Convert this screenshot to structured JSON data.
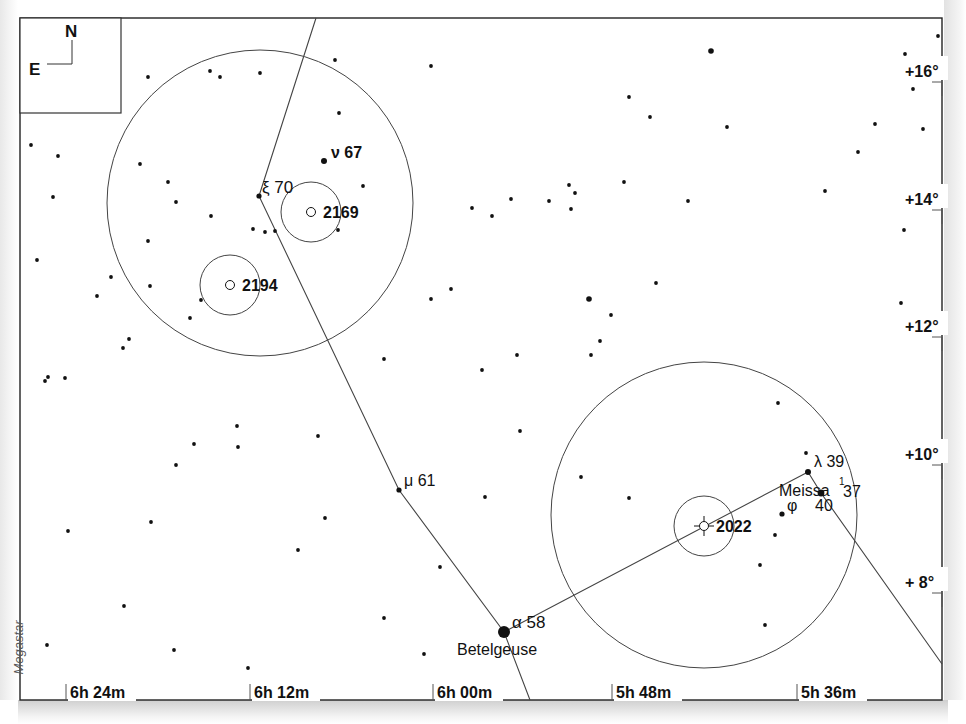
{
  "compass": {
    "north": "N",
    "east": "E"
  },
  "credit": "Megastar",
  "colors": {
    "ink": "#111111",
    "line": "#444444",
    "paper": "#ffffff"
  },
  "ra_axis": {
    "ticks": [
      {
        "label": "6h 24m",
        "x": 66
      },
      {
        "label": "6h 12m",
        "x": 250
      },
      {
        "label": "6h 00m",
        "x": 433
      },
      {
        "label": "5h 48m",
        "x": 612
      },
      {
        "label": "5h 36m",
        "x": 797
      }
    ]
  },
  "dec_axis": {
    "ticks": [
      {
        "label": "+16°",
        "y": 72
      },
      {
        "label": "+14°",
        "y": 200
      },
      {
        "label": "+12°",
        "y": 327
      },
      {
        "label": "+10°",
        "y": 455
      },
      {
        "label": "+ 8°",
        "y": 583
      }
    ]
  },
  "named_stars": [
    {
      "greek": "ν",
      "flamsteed": "67",
      "x": 324,
      "y": 161,
      "r": 3
    },
    {
      "greek": "ξ",
      "flamsteed": "70",
      "x": 259,
      "y": 196,
      "r": 2.6
    },
    {
      "greek": "μ",
      "flamsteed": "61",
      "x": 399,
      "y": 490,
      "r": 2.6
    },
    {
      "greek": "α",
      "flamsteed": "58",
      "name": "Betelgeuse",
      "x": 504,
      "y": 632,
      "r": 6
    },
    {
      "greek": "λ",
      "flamsteed": "39",
      "x": 808,
      "y": 472,
      "r": 3
    },
    {
      "greek": "φ",
      "flamsteed": "40",
      "x": 782,
      "y": 514,
      "r": 2.6
    },
    {
      "greek": "φ¹",
      "flamsteed": "37",
      "name": "Meissa",
      "x": 821,
      "y": 493,
      "r": 3.4
    }
  ],
  "labels": {
    "nu": "ν 67",
    "xi": "ξ 70",
    "mu": "μ 61",
    "alpha": "α 58",
    "betelgeuse": "Betelgeuse",
    "lambda": "λ 39",
    "meissa": "Meissa",
    "phi1_sup": "1",
    "phi1_num": "37",
    "phi": "φ",
    "phi_num": "40"
  },
  "deep_sky": [
    {
      "id": "2169",
      "x": 311,
      "y": 212,
      "ring_r": 30,
      "symbol": "open-cluster"
    },
    {
      "id": "2194",
      "x": 230,
      "y": 285,
      "ring_r": 30,
      "symbol": "open-cluster"
    },
    {
      "id": "2022",
      "x": 704,
      "y": 526,
      "ring_r": 30,
      "symbol": "planetary-nebula"
    }
  ],
  "finder_circles": [
    {
      "x": 260,
      "y": 203,
      "r": 153
    },
    {
      "x": 704,
      "y": 515,
      "r": 153
    }
  ],
  "constellation_lines": [
    [
      [
        316,
        18
      ],
      [
        259,
        196
      ],
      [
        399,
        490
      ],
      [
        504,
        632
      ],
      [
        530,
        700
      ]
    ],
    [
      [
        504,
        632
      ],
      [
        808,
        472
      ],
      [
        821,
        493
      ],
      [
        942,
        664
      ]
    ]
  ],
  "field_stars": [
    [
      148,
      77
    ],
    [
      210,
      71
    ],
    [
      220,
      77
    ],
    [
      260,
      73
    ],
    [
      335,
      60
    ],
    [
      431,
      66
    ],
    [
      31,
      145
    ],
    [
      58,
      156
    ],
    [
      140,
      164
    ],
    [
      168,
      182
    ],
    [
      53,
      197
    ],
    [
      176,
      202
    ],
    [
      211,
      216
    ],
    [
      253,
      229
    ],
    [
      265,
      232
    ],
    [
      275,
      231
    ],
    [
      148,
      241
    ],
    [
      37,
      260
    ],
    [
      111,
      277
    ],
    [
      97,
      296
    ],
    [
      150,
      286
    ],
    [
      201,
      300
    ],
    [
      190,
      318
    ],
    [
      123,
      348
    ],
    [
      129,
      339
    ],
    [
      45,
      381
    ],
    [
      48,
      377
    ],
    [
      65,
      378
    ],
    [
      339,
      113
    ],
    [
      363,
      186
    ],
    [
      338,
      230
    ],
    [
      384,
      359
    ],
    [
      472,
      208
    ],
    [
      492,
      216
    ],
    [
      511,
      199
    ],
    [
      549,
      201
    ],
    [
      569,
      185
    ],
    [
      575,
      193
    ],
    [
      571,
      209
    ],
    [
      624,
      182
    ],
    [
      688,
      201
    ],
    [
      629,
      97
    ],
    [
      650,
      117
    ],
    [
      727,
      127
    ],
    [
      825,
      191
    ],
    [
      858,
      152
    ],
    [
      875,
      124
    ],
    [
      905,
      54
    ],
    [
      938,
      36
    ],
    [
      913,
      89
    ],
    [
      923,
      129
    ],
    [
      904,
      230
    ],
    [
      901,
      303
    ],
    [
      451,
      289
    ],
    [
      431,
      299
    ],
    [
      589,
      299
    ],
    [
      611,
      315
    ],
    [
      656,
      283
    ],
    [
      600,
      341
    ],
    [
      591,
      355
    ],
    [
      517,
      355
    ],
    [
      482,
      370
    ],
    [
      520,
      431
    ],
    [
      485,
      497
    ],
    [
      581,
      477
    ],
    [
      629,
      498
    ],
    [
      778,
      403
    ],
    [
      806,
      453
    ],
    [
      775,
      535
    ],
    [
      760,
      565
    ],
    [
      765,
      625
    ],
    [
      176,
      465
    ],
    [
      194,
      444
    ],
    [
      237,
      426
    ],
    [
      238,
      447
    ],
    [
      318,
      436
    ],
    [
      68,
      531
    ],
    [
      151,
      522
    ],
    [
      325,
      518
    ],
    [
      298,
      550
    ],
    [
      440,
      567
    ],
    [
      124,
      606
    ],
    [
      47,
      645
    ],
    [
      174,
      650
    ],
    [
      248,
      668
    ],
    [
      384,
      618
    ],
    [
      424,
      654
    ]
  ],
  "bright_field_stars": [
    [
      711,
      51
    ],
    [
      589,
      299
    ]
  ]
}
